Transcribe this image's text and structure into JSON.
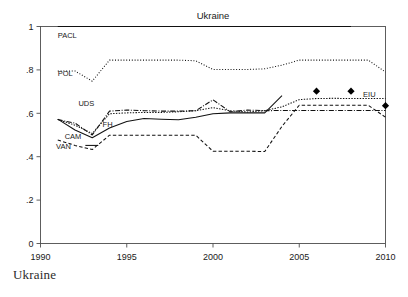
{
  "caption": "Ukraine",
  "chart_data": {
    "type": "line",
    "title": "Ukraine",
    "xlabel": "",
    "ylabel": "",
    "xlim": [
      1990,
      2010
    ],
    "ylim": [
      0,
      1
    ],
    "grid": false,
    "legend": "inline-labels",
    "xticks": [
      1990,
      1995,
      2000,
      2005,
      2010
    ],
    "xtick_labels": [
      "1990",
      "1995",
      "2000",
      "2005",
      "2010"
    ],
    "yticks": [
      0,
      0.2,
      0.4,
      0.6,
      0.8,
      1
    ],
    "ytick_labels": [
      "0",
      ".2",
      ".4",
      ".6",
      ".8",
      "1"
    ],
    "series": [
      {
        "name": "PACL",
        "label": "PACL",
        "style": "solid",
        "dash": "none",
        "width": 1.1,
        "label_x": 1991.0,
        "label_y": 0.962,
        "x": [
          1991,
          1992,
          1993,
          1994,
          1995,
          1996,
          1997,
          1998,
          1999,
          2000,
          2001,
          2002,
          2003,
          2004,
          2005,
          2006,
          2007,
          2008
        ],
        "values": [
          1,
          1,
          1,
          1,
          1,
          1,
          1,
          1,
          1,
          1,
          1,
          1,
          1,
          1,
          1,
          1,
          1,
          1
        ]
      },
      {
        "name": "POL",
        "label": "POL",
        "style": "dotted",
        "dash": "1,1.8",
        "width": 1.0,
        "label_x": 1991.0,
        "label_y": 0.786,
        "x": [
          1991,
          1992,
          1993,
          1994,
          1995,
          1996,
          1997,
          1998,
          1999,
          2000,
          2001,
          2002,
          2003,
          2004,
          2005,
          2006,
          2007,
          2008,
          2009,
          2010
        ],
        "values": [
          0.795,
          0.795,
          0.748,
          0.845,
          0.845,
          0.845,
          0.845,
          0.845,
          0.842,
          0.802,
          0.802,
          0.802,
          0.805,
          0.822,
          0.845,
          0.845,
          0.845,
          0.845,
          0.845,
          0.79
        ]
      },
      {
        "name": "UDS",
        "label": "UDS",
        "style": "dotted-fine",
        "dash": "1.4,1.4",
        "width": 1.0,
        "label_x": 1992.2,
        "label_y": 0.648,
        "x": [
          1991,
          1992,
          1993,
          1994,
          1995,
          1996,
          1997,
          1998,
          1999,
          2000,
          2001,
          2002,
          2003,
          2004,
          2005,
          2006,
          2007,
          2008,
          2009,
          2010
        ],
        "values": [
          0.572,
          0.545,
          0.507,
          0.598,
          0.602,
          0.604,
          0.604,
          0.607,
          0.612,
          0.626,
          0.612,
          0.606,
          0.612,
          0.63,
          0.663,
          0.668,
          0.669,
          0.668,
          0.668,
          0.668
        ]
      },
      {
        "name": "FH",
        "label": "FH",
        "style": "dash-dot",
        "dash": "5,1.6,1,1.6",
        "width": 1.05,
        "label_x": 1993.6,
        "label_y": 0.552,
        "x": [
          1991,
          1992,
          1993,
          1994,
          1995,
          1996,
          1997,
          1998,
          1999,
          2000,
          2001,
          2002,
          2003,
          2004,
          2005,
          2006,
          2007,
          2008,
          2009,
          2010
        ],
        "values": [
          0.571,
          0.555,
          0.5,
          0.61,
          0.615,
          0.612,
          0.61,
          0.61,
          0.612,
          0.662,
          0.607,
          0.615,
          0.612,
          0.613,
          0.613,
          0.613,
          0.613,
          0.613,
          0.613,
          0.613
        ]
      },
      {
        "name": "CAM",
        "label": "CAM",
        "style": "solid",
        "dash": "none",
        "width": 1.15,
        "label_x": 1991.4,
        "label_y": 0.497,
        "x": [
          1991,
          1992,
          1993,
          1994,
          1995,
          1996,
          1997,
          1998,
          1999,
          2000,
          2001,
          2002,
          2003,
          2004
        ],
        "values": [
          0.573,
          0.523,
          0.487,
          0.532,
          0.562,
          0.576,
          0.573,
          0.57,
          0.582,
          0.598,
          0.602,
          0.602,
          0.602,
          0.682
        ]
      },
      {
        "name": "VAN",
        "label": "VAN",
        "style": "dashed",
        "dash": "3.4,2.2",
        "width": 1.05,
        "label_x": 1990.9,
        "label_y": 0.448,
        "x": [
          1991,
          1992,
          1993,
          1994,
          1995,
          1996,
          1997,
          1998,
          1999,
          2000,
          2001,
          2002,
          2003,
          2004,
          2005,
          2006,
          2007,
          2008,
          2009,
          2010
        ],
        "values": [
          0.477,
          0.452,
          0.433,
          0.499,
          0.499,
          0.499,
          0.499,
          0.499,
          0.499,
          0.425,
          0.425,
          0.425,
          0.424,
          0.54,
          0.637,
          0.637,
          0.637,
          0.637,
          0.637,
          0.582
        ]
      },
      {
        "name": "EIU",
        "label": "EIU",
        "style": "markers",
        "dash": "none",
        "width": 0,
        "marker": "diamond",
        "label_x": 2008.7,
        "label_y": 0.69,
        "x": [
          2006,
          2008,
          2010
        ],
        "values": [
          0.702,
          0.702,
          0.635
        ]
      }
    ]
  }
}
